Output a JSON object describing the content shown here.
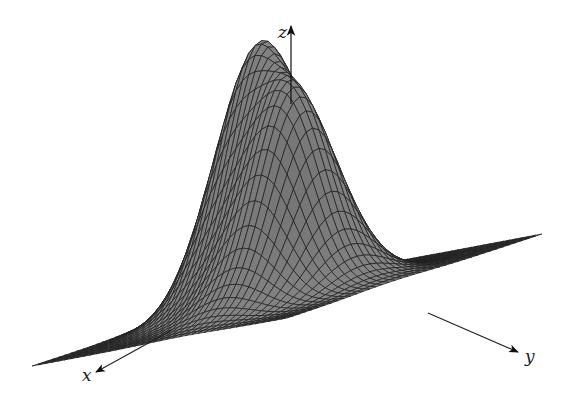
{
  "figure": {
    "type": "3d-surface",
    "surface_color": "#8f8f8f",
    "mesh_color": "#1e1e1e",
    "background": "#ffffff"
  },
  "axes": {
    "x": {
      "label": "x"
    },
    "y": {
      "label": "y"
    },
    "z": {
      "label": "z"
    }
  },
  "chart_data": {
    "type": "surface",
    "title": "",
    "xlabel": "x",
    "ylabel": "y",
    "zlabel": "z",
    "grid_resolution": 40,
    "domain": {
      "x": [
        -3,
        3
      ],
      "y": [
        -3,
        3
      ]
    },
    "peaks": [
      {
        "name": "left-peak",
        "x": -0.2,
        "y": -0.9,
        "height": 1.0,
        "spread": 0.75
      },
      {
        "name": "right-peak",
        "x": 0.5,
        "y": 0.6,
        "height": 0.82,
        "spread": 0.8
      }
    ],
    "projection": {
      "origin": [
        287,
        300
      ],
      "x_dir": [
        -42.5,
        14.0
      ],
      "y_dir": [
        42.5,
        -8.0
      ],
      "z_scale": 235
    }
  }
}
